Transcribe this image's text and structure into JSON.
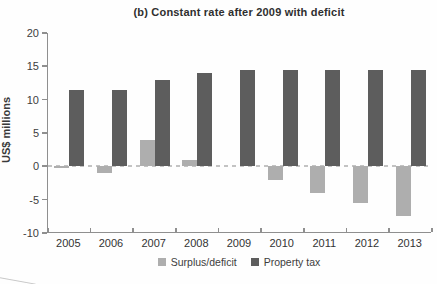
{
  "title": "(b) Constant rate after 2009 with deficit",
  "y_axis_label": "US$ millions",
  "colors": {
    "surplus_deficit": "#aeaeae",
    "property_tax": "#5d5d5d",
    "zero_line": "#c3c3c3",
    "axis": "#8f8f8f",
    "text": "#3d3d3d"
  },
  "legend": {
    "surplus_label": "Surplus/deficit",
    "property_label": "Property tax"
  },
  "chart_data": {
    "type": "bar",
    "title": "(b) Constant rate after 2009 with deficit",
    "xlabel": "",
    "ylabel": "US$ millions",
    "categories": [
      "2005",
      "2006",
      "2007",
      "2008",
      "2009",
      "2010",
      "2011",
      "2012",
      "2013"
    ],
    "series": [
      {
        "name": "Surplus/deficit",
        "color": "#aeaeae",
        "values": [
          -0.3,
          -1,
          4,
          1,
          0,
          -2,
          -4,
          -5.5,
          -7.5
        ]
      },
      {
        "name": "Property tax",
        "color": "#5d5d5d",
        "values": [
          11.5,
          11.5,
          13,
          14,
          14.5,
          14.5,
          14.5,
          14.5,
          14.5
        ]
      }
    ],
    "ylim": [
      -10,
      20
    ],
    "yticks": [
      20,
      15,
      10,
      5,
      0,
      -5,
      -10
    ],
    "grid": false,
    "zero_baseline": "dashed",
    "legend_position": "bottom"
  }
}
